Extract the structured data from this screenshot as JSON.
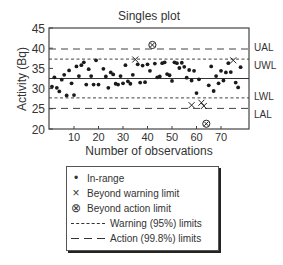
{
  "chart_data": {
    "type": "scatter",
    "title": "Singles plot",
    "xlabel": "Number of observations",
    "ylabel": "Activity (Bq)",
    "xlim": [
      0,
      79
    ],
    "ylim": [
      20,
      45
    ],
    "xticks": [
      10,
      20,
      30,
      40,
      50,
      60,
      70
    ],
    "yticks": [
      20,
      25,
      30,
      35,
      40,
      45
    ],
    "grid": false,
    "center_line": 32.5,
    "limits": [
      {
        "name": "UAL",
        "value": 39.8,
        "style": "long-dash",
        "kind": "action"
      },
      {
        "name": "UWL",
        "value": 37.3,
        "style": "short-dash",
        "kind": "warning"
      },
      {
        "name": "LWL",
        "value": 27.7,
        "style": "short-dash",
        "kind": "warning"
      },
      {
        "name": "LAL",
        "value": 25.1,
        "style": "long-dash",
        "kind": "action"
      }
    ],
    "series": [
      {
        "name": "In-range",
        "marker": "dot",
        "points": [
          [
            1,
            30.5
          ],
          [
            2,
            32.8
          ],
          [
            3,
            30.2
          ],
          [
            4,
            29.3
          ],
          [
            5,
            32.2
          ],
          [
            6,
            33.4
          ],
          [
            7,
            28.3
          ],
          [
            8,
            34.5
          ],
          [
            9,
            31.3
          ],
          [
            10,
            28.4
          ],
          [
            11,
            35.5
          ],
          [
            12,
            33.1
          ],
          [
            13,
            35.8
          ],
          [
            14,
            36.5
          ],
          [
            15,
            31.0
          ],
          [
            16,
            34.8
          ],
          [
            17,
            33.1
          ],
          [
            18,
            31.0
          ],
          [
            19,
            37.0
          ],
          [
            20,
            31.0
          ],
          [
            22,
            34.9
          ],
          [
            23,
            33.0
          ],
          [
            24,
            30.2
          ],
          [
            25,
            34.0
          ],
          [
            26,
            33.5
          ],
          [
            27,
            31.2
          ],
          [
            28,
            31.0
          ],
          [
            29,
            33.1
          ],
          [
            30,
            31.3
          ],
          [
            31,
            35.8
          ],
          [
            32,
            31.8
          ],
          [
            33,
            31.2
          ],
          [
            34,
            33.4
          ],
          [
            36,
            36.0
          ],
          [
            37,
            31.5
          ],
          [
            38,
            35.7
          ],
          [
            39,
            31.6
          ],
          [
            40,
            36.0
          ],
          [
            41,
            34.4
          ],
          [
            43,
            36.2
          ],
          [
            44,
            32.8
          ],
          [
            45,
            33.0
          ],
          [
            46,
            36.3
          ],
          [
            47,
            36.5
          ],
          [
            48,
            33.6
          ],
          [
            49,
            33.3
          ],
          [
            50,
            31.9
          ],
          [
            51,
            36.5
          ],
          [
            52,
            36.3
          ],
          [
            53,
            35.1
          ],
          [
            54,
            36.4
          ],
          [
            55,
            35.4
          ],
          [
            56,
            32.7
          ],
          [
            57,
            34.6
          ],
          [
            58,
            32.0
          ],
          [
            59,
            34.4
          ],
          [
            60,
            28.9
          ],
          [
            61,
            32.3
          ],
          [
            65,
            30.8
          ],
          [
            66,
            35.5
          ],
          [
            67,
            29.4
          ],
          [
            68,
            33.1
          ],
          [
            69,
            31.3
          ],
          [
            70,
            34.4
          ],
          [
            71,
            32.0
          ],
          [
            72,
            34.0
          ],
          [
            73,
            36.3
          ],
          [
            74,
            34.1
          ],
          [
            76,
            31.5
          ],
          [
            77,
            30.3
          ],
          [
            78,
            35.3
          ]
        ]
      },
      {
        "name": "Beyond warning limit",
        "marker": "x",
        "points": [
          [
            35,
            37.2
          ],
          [
            58,
            25.9
          ],
          [
            62,
            26.5
          ],
          [
            63,
            25.7
          ],
          [
            75,
            37.0
          ]
        ]
      },
      {
        "name": "Beyond action limit",
        "marker": "circled-x",
        "points": [
          [
            42,
            40.8
          ],
          [
            64,
            21.3
          ]
        ]
      }
    ],
    "legend": {
      "position": "below",
      "entries": [
        {
          "symbol": "•",
          "label": "In-range"
        },
        {
          "symbol": "×",
          "label": "Beyond warning limit"
        },
        {
          "symbol": "⊗",
          "label": "Beyond action limit"
        },
        {
          "symbol": "------",
          "label": "Warning (95%) limits"
        },
        {
          "symbol": "— — —",
          "label": "Action (99.8%) limits"
        }
      ]
    }
  }
}
